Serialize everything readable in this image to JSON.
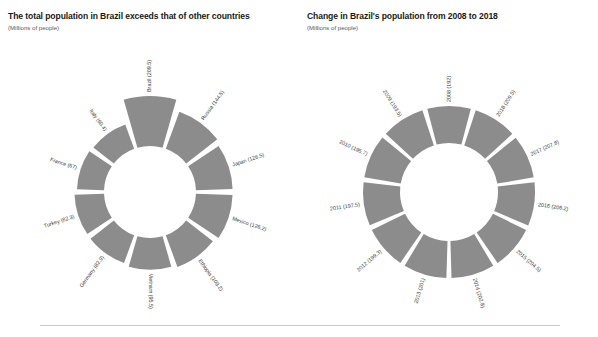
{
  "charts": [
    {
      "title": "The total population in Brazil exceeds that of other countries",
      "subtitle": "(Millions of people)"
    },
    {
      "title": "Change in Brazil's population from 2008 to 2018",
      "subtitle": "(Millions of people)"
    }
  ],
  "chart_data": [
    {
      "type": "pie",
      "variant": "donut",
      "title": "The total population in Brazil exceeds that of other countries",
      "subtitle": "(Millions of people)",
      "ylabel": "Millions of people",
      "xlabel": "",
      "legend": "none",
      "grid": false,
      "color": "#8c8c8c",
      "categories": [
        "Brazil",
        "Russia",
        "Japan",
        "Mexico",
        "Ethiopia",
        "Vietnam",
        "Germany",
        "Turkey",
        "France",
        "Italy"
      ],
      "values": [
        209.5,
        144.5,
        126.5,
        126.2,
        109.2,
        95.5,
        82.9,
        82.3,
        67,
        60.4
      ],
      "labels": [
        "Brazil (209.5)",
        "Russia (144.5)",
        "Japan (126.5)",
        "Mexico (126.2)",
        "Ethiopia (109.2)",
        "Vietnam (95.5)",
        "Germany (82.9)",
        "Turkey (82.3)",
        "France (67)",
        "Italy (60.4)"
      ]
    },
    {
      "type": "pie",
      "variant": "donut",
      "title": "Change in Brazil's population from 2008 to 2018",
      "subtitle": "(Millions of people)",
      "ylabel": "Millions of people",
      "xlabel": "",
      "legend": "none",
      "grid": false,
      "color": "#8c8c8c",
      "categories": [
        "2018",
        "2017",
        "2016",
        "2015",
        "2014",
        "2013",
        "2012",
        "2011",
        "2010",
        "2009",
        "2008"
      ],
      "values": [
        209.5,
        207.8,
        206.2,
        204.5,
        202.8,
        201,
        199.3,
        197.5,
        195.7,
        193.5,
        192
      ],
      "labels": [
        "2018 (209.5)",
        "2017 (207.8)",
        "2016 (206.2)",
        "2015 (204.5)",
        "2014 (202.8)",
        "2013 (201)",
        "2012 (199.3)",
        "2011 (197.5)",
        "2010 (195.7)",
        "2009 (193.5)",
        "2008 (192)"
      ]
    }
  ]
}
